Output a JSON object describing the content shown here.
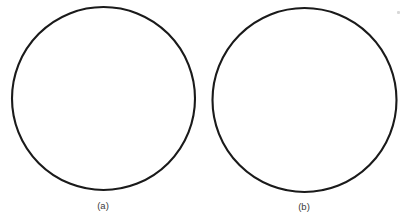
{
  "figure": {
    "background_color": "#ffffff",
    "stroke_color": "#1a1a1a",
    "caption_color": "#3a3a3a",
    "width": 411,
    "height": 224,
    "panels": [
      {
        "id": "a",
        "caption": "(a)",
        "shape": "circle",
        "center_x": 103.5,
        "center_y": 98.5,
        "radius": 91.5,
        "stroke_width": 2.1,
        "fill": "none"
      },
      {
        "id": "b",
        "caption": "(b)",
        "shape": "circle",
        "center_x": 304.5,
        "center_y": 100.0,
        "radius": 92.0,
        "stroke_width": 2.1,
        "fill": "none"
      }
    ],
    "artifact": {
      "name": "scan-speck",
      "x": 397,
      "y": 11,
      "color": "#d8d8d8"
    }
  }
}
